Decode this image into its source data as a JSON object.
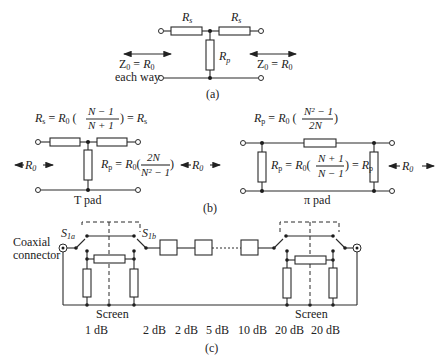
{
  "part_a": {
    "label": "(a)",
    "rs_left": "R",
    "rs_left_sub": "s",
    "rs_right": "R",
    "rs_right_sub": "s",
    "rp": "R",
    "rp_sub": "p",
    "z_left": "Z",
    "z_left_sub": "0",
    "z_left_eq": " = ",
    "z_left_r": "R",
    "z_left_r_sub": "0",
    "each_way": "each way",
    "z_right": "Z",
    "z_right_sub": "0",
    "z_right_eq": " = ",
    "z_right_r": "R",
    "z_right_r_sub": "0"
  },
  "part_b": {
    "label": "(b)",
    "t_pad": {
      "formula_rs": "Rs = R0 ((N − 1)/(N + 1)) = Rs",
      "formula_rp": "Rp = R0 (2N/(N² − 1))",
      "r0_left": "R",
      "r0_left_sub": "0",
      "r0_right": "R",
      "r0_right_sub": "0",
      "name": "T pad",
      "rs_num": "N − 1",
      "rs_den": "N + 1",
      "rp_num": "2N",
      "rp_den": "N² − 1"
    },
    "pi_pad": {
      "formula_rp_top": "Rp = R0 ((N² − 1)/2N)",
      "formula_rp_mid": "Rp = R0 ((N + 1)/(N − 1)) = Rp",
      "r0_right": "R",
      "r0_right_sub": "0",
      "name": "π pad",
      "top_num": "N² − 1",
      "top_den": "2N",
      "mid_num": "N + 1",
      "mid_den": "N − 1"
    }
  },
  "part_c": {
    "label": "(c)",
    "coaxial_connector": [
      "Coaxial",
      "connector"
    ],
    "switch_a": "S",
    "switch_a_sub": "1a",
    "switch_b": "S",
    "switch_b_sub": "1b",
    "screen_left": "Screen",
    "screen_right": "Screen",
    "attenuations": [
      "1 dB",
      "2 dB",
      "2 dB",
      "5 dB",
      "10 dB",
      "20 dB",
      "20 dB"
    ]
  }
}
